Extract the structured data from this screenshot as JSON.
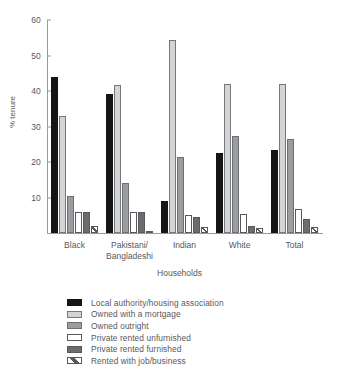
{
  "chart_data": {
    "type": "bar",
    "title": "",
    "xlabel": "Households",
    "ylabel": "% tenure",
    "ylim": [
      0,
      60
    ],
    "yticks": [
      0,
      10,
      20,
      30,
      40,
      50,
      60
    ],
    "grid": false,
    "legend_position": "below",
    "categories": [
      "Black",
      "Pakistani/\nBangladeshi",
      "Indian",
      "White",
      "Total"
    ],
    "series": [
      {
        "name": "Local authority/housing association",
        "color": "#151515",
        "values": [
          44,
          39.3,
          9,
          22.5,
          23.5
        ]
      },
      {
        "name": "Owned with a mortgage",
        "color": "#d2d4d6",
        "values": [
          33,
          41.8,
          54.5,
          42,
          42
        ]
      },
      {
        "name": "Owned outright",
        "color": "#9b9da0",
        "values": [
          10.3,
          14,
          21.4,
          27.4,
          26.5
        ]
      },
      {
        "name": "Private rented unfurnished",
        "color": "#ffffff",
        "values": [
          6,
          6,
          5,
          5.4,
          6.8
        ]
      },
      {
        "name": "Private rented furnished",
        "color": "#6a6c6f",
        "values": [
          6,
          6,
          4.6,
          2,
          4
        ]
      },
      {
        "name": "Rented with job/business",
        "color": "#ffffff",
        "values": [
          2,
          0.7,
          1.8,
          1.3,
          1.8
        ]
      }
    ]
  },
  "axis": {
    "y_title": "% tenure",
    "x_title": "Households",
    "y_tick_labels": [
      "60",
      "50",
      "40",
      "30",
      "20",
      "10"
    ]
  },
  "legend": {
    "items": [
      {
        "label": "Local authority/housing association",
        "swatch": "solid-black-swatch"
      },
      {
        "label": "Owned with a mortgage",
        "swatch": "light-gray-swatch"
      },
      {
        "label": "Owned outright",
        "swatch": "medium-gray-swatch"
      },
      {
        "label": "Private rented unfurnished",
        "swatch": "white-swatch"
      },
      {
        "label": "Private rented furnished",
        "swatch": "dark-gray-swatch"
      },
      {
        "label": "Rented with job/business",
        "swatch": "hatched-swatch"
      }
    ]
  }
}
